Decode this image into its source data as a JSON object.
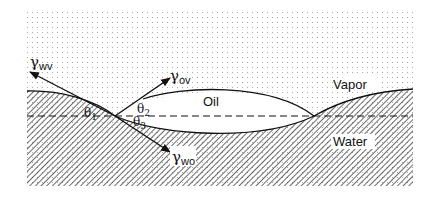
{
  "diagram": {
    "phases": {
      "vapor": "Vapor",
      "oil": "Oil",
      "water": "Water"
    },
    "tensions": {
      "wv": {
        "symbol": "γ",
        "subscript": "wv"
      },
      "ov": {
        "symbol": "γ",
        "subscript": "ov"
      },
      "wo": {
        "symbol": "γ",
        "subscript": "wo"
      }
    },
    "angles": {
      "theta1": {
        "symbol": "θ",
        "subscript": "1"
      },
      "theta2": {
        "symbol": "θ",
        "subscript": "2"
      },
      "theta3": {
        "symbol": "θ",
        "subscript": "3"
      }
    },
    "colors": {
      "ink": "#111111",
      "dots": "#9a9a9a",
      "hatch": "#333333",
      "background": "#ffffff"
    }
  }
}
